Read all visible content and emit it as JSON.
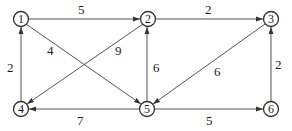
{
  "diagram": {
    "type": "directed-weighted-graph",
    "nodes": [
      {
        "id": "1",
        "label": "1",
        "x": 21,
        "y": 19
      },
      {
        "id": "2",
        "label": "2",
        "x": 148,
        "y": 19
      },
      {
        "id": "3",
        "label": "3",
        "x": 271,
        "y": 19
      },
      {
        "id": "4",
        "label": "4",
        "x": 21,
        "y": 109
      },
      {
        "id": "5",
        "label": "5",
        "x": 147,
        "y": 109
      },
      {
        "id": "6",
        "label": "6",
        "x": 271,
        "y": 109
      }
    ],
    "edges": [
      {
        "from": "1",
        "to": "2",
        "weight": "5"
      },
      {
        "from": "2",
        "to": "3",
        "weight": "2"
      },
      {
        "from": "1",
        "to": "5",
        "weight": "4"
      },
      {
        "from": "2",
        "to": "4",
        "weight": "9"
      },
      {
        "from": "4",
        "to": "1",
        "weight": "2"
      },
      {
        "from": "5",
        "to": "2",
        "weight": "6"
      },
      {
        "from": "3",
        "to": "5",
        "weight": "6"
      },
      {
        "from": "6",
        "to": "3",
        "weight": "2"
      },
      {
        "from": "5",
        "to": "4",
        "weight": "7"
      },
      {
        "from": "5",
        "to": "6",
        "weight": "5"
      }
    ]
  }
}
